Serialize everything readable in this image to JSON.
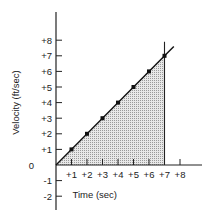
{
  "chart_data": {
    "type": "line",
    "title": "",
    "xlabel": "Time (sec)",
    "ylabel": "Velocity (ft/sec)",
    "x_ticks": [
      "+1",
      "+2",
      "+3",
      "+4",
      "+5",
      "+6",
      "+7",
      "+8"
    ],
    "y_ticks_pos": [
      "+1",
      "+2",
      "+3",
      "+4",
      "+5",
      "+6",
      "+7",
      "+8"
    ],
    "y_ticks_neg": [
      "-1",
      "-2"
    ],
    "origin_label": "0",
    "xlim": [
      0,
      8.5
    ],
    "ylim": [
      -2.5,
      9.5
    ],
    "series": [
      {
        "name": "velocity",
        "x": [
          0,
          1,
          2,
          3,
          4,
          5,
          6,
          7
        ],
        "y": [
          0,
          1,
          2,
          3,
          4,
          5,
          6,
          7
        ]
      }
    ],
    "shaded_region": {
      "x_from": 0,
      "x_to": 7,
      "description": "area under line (displacement)"
    },
    "vertical_marker_x": 7,
    "grid": false
  }
}
